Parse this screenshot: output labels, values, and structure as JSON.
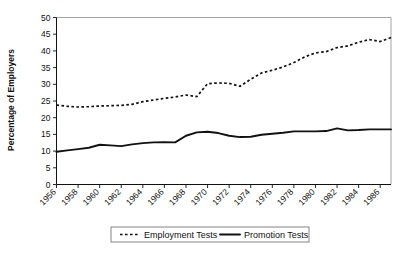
{
  "chart_data": {
    "type": "line",
    "title": "",
    "xlabel": "",
    "ylabel": "Percentage of Employers",
    "ylim": [
      0,
      50
    ],
    "ytick_step": 5,
    "yticks": [
      "0",
      "5",
      "10",
      "15",
      "20",
      "25",
      "30",
      "35",
      "40",
      "45",
      "50"
    ],
    "xlim": [
      1956,
      1987
    ],
    "xticks": [
      "1956",
      "1958",
      "1960",
      "1962",
      "1964",
      "1966",
      "1968",
      "1970",
      "1972",
      "1974",
      "1976",
      "1978",
      "1980",
      "1982",
      "1984",
      "1986"
    ],
    "grid": false,
    "legend_position": "bottom",
    "x": [
      1956,
      1957,
      1958,
      1959,
      1960,
      1961,
      1962,
      1963,
      1964,
      1965,
      1966,
      1967,
      1968,
      1969,
      1970,
      1971,
      1972,
      1973,
      1974,
      1975,
      1976,
      1977,
      1978,
      1979,
      1980,
      1981,
      1982,
      1983,
      1984,
      1985,
      1986,
      1987
    ],
    "series": [
      {
        "name": "Employment Tests",
        "style": "dashed",
        "color": "#111111",
        "values": [
          23.8,
          23.4,
          23.2,
          23.3,
          23.5,
          23.6,
          23.7,
          24.0,
          24.8,
          25.3,
          25.8,
          26.2,
          26.8,
          26.3,
          30.2,
          30.4,
          30.3,
          29.4,
          31.5,
          33.4,
          34.2,
          35.2,
          36.5,
          38.2,
          39.4,
          39.8,
          41.0,
          41.5,
          42.6,
          43.4,
          42.8,
          44.0
        ]
      },
      {
        "name": "Promotion Tests",
        "style": "solid",
        "color": "#111111",
        "values": [
          9.8,
          10.2,
          10.6,
          11.0,
          11.9,
          11.7,
          11.5,
          12.0,
          12.4,
          12.6,
          12.7,
          12.6,
          14.6,
          15.6,
          15.8,
          15.4,
          14.6,
          14.2,
          14.3,
          14.9,
          15.2,
          15.5,
          15.9,
          15.9,
          15.9,
          16.0,
          16.8,
          16.2,
          16.3,
          16.5,
          16.5,
          16.5
        ]
      }
    ]
  },
  "legend": {
    "items": [
      {
        "label": "Employment Tests",
        "style": "dashed"
      },
      {
        "label": "Promotion Tests",
        "style": "solid"
      }
    ]
  }
}
